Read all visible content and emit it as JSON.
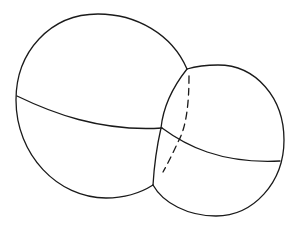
{
  "diagram": {
    "type": "two-intersecting-spheres",
    "colors": {
      "stroke": "#1a1a1a",
      "background": "#ffffff"
    },
    "large_sphere": {
      "label": ""
    },
    "small_sphere": {
      "label": ""
    },
    "hidden_edge": {
      "style": "dashed"
    }
  }
}
